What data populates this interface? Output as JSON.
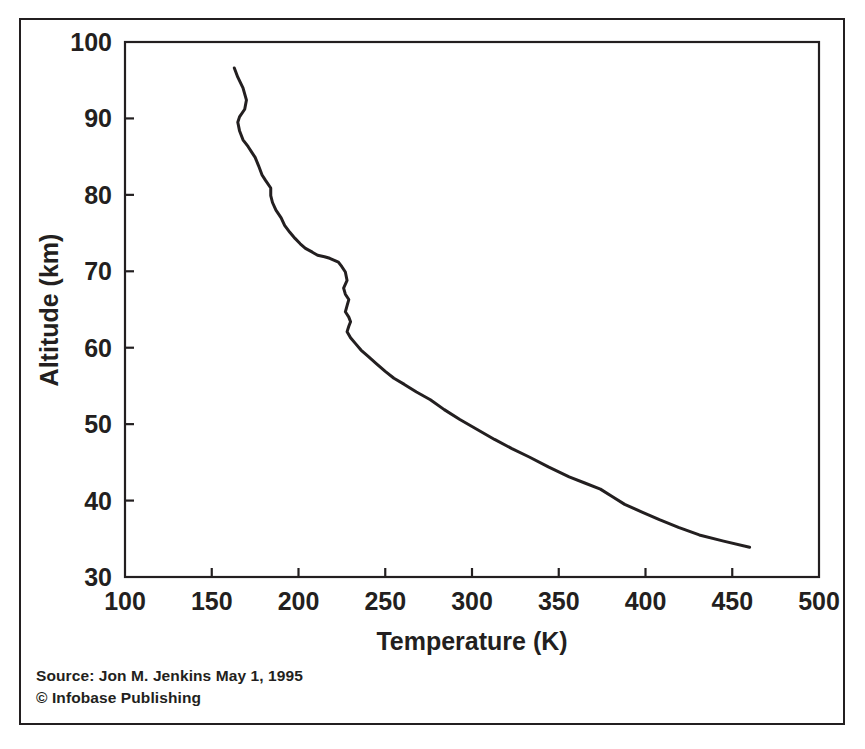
{
  "figure": {
    "source_line_1": "Source: Jon M. Jenkins May 1, 1995",
    "source_line_2": "© Infobase Publishing"
  },
  "chart_data": {
    "type": "line",
    "title": "",
    "xlabel": "Temperature (K)",
    "ylabel": "Altitude (km)",
    "xlim": [
      100,
      500
    ],
    "ylim": [
      30,
      100
    ],
    "y_inverted": false,
    "xticks": [
      100,
      150,
      200,
      250,
      300,
      350,
      400,
      450,
      500
    ],
    "yticks": [
      30,
      40,
      50,
      60,
      70,
      80,
      90,
      100
    ],
    "xtick_labels": [
      "100",
      "150",
      "200",
      "250",
      "300",
      "350",
      "400",
      "450",
      "500"
    ],
    "ytick_labels": [
      "30",
      "40",
      "50",
      "60",
      "70",
      "80",
      "90",
      "100"
    ],
    "grid": false,
    "legend": "none",
    "series": [
      {
        "name": "Venus temperature profile",
        "color": "#231f20",
        "line_width": 3,
        "x_label": "Temperature (K)",
        "y_label": "Altitude (km)",
        "x": [
          163,
          165,
          168,
          170,
          169,
          166,
          165,
          166,
          168,
          171,
          173,
          175,
          177,
          179,
          181,
          184,
          184,
          185,
          187,
          190,
          192,
          195,
          198,
          201,
          204,
          208,
          211,
          215,
          218,
          221,
          223,
          225,
          227,
          228,
          226,
          227,
          229,
          228,
          227,
          229,
          230,
          229,
          228,
          230,
          233,
          236,
          240,
          245,
          250,
          255,
          261,
          268,
          276,
          284,
          293,
          303,
          313,
          323,
          333,
          344,
          356,
          365,
          374,
          381,
          388,
          398,
          408,
          419,
          431,
          445,
          460
        ],
        "y": [
          96.6,
          95.4,
          94.0,
          92.4,
          91.2,
          90.2,
          89.5,
          88.4,
          87.2,
          86.3,
          85.6,
          84.9,
          83.8,
          82.6,
          81.9,
          80.9,
          79.9,
          79.0,
          78.0,
          77.0,
          76.0,
          75.1,
          74.3,
          73.6,
          73.0,
          72.5,
          72.1,
          71.9,
          71.7,
          71.4,
          71.2,
          70.6,
          69.9,
          68.8,
          67.8,
          67.0,
          66.3,
          65.5,
          64.7,
          64.0,
          63.4,
          62.8,
          62.1,
          61.3,
          60.5,
          59.7,
          58.9,
          57.9,
          56.9,
          56.0,
          55.2,
          54.2,
          53.2,
          51.9,
          50.6,
          49.3,
          48.0,
          46.8,
          45.7,
          44.4,
          43.1,
          42.3,
          41.5,
          40.5,
          39.5,
          38.5,
          37.5,
          36.5,
          35.5,
          34.7,
          33.9
        ]
      }
    ]
  }
}
